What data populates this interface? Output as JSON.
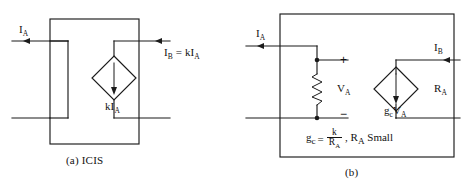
{
  "figure": {
    "background_color": "#ffffff",
    "line_color": "#1b1b1b",
    "panels": [
      {
        "id": "a",
        "caption": "(a) ICIS",
        "labels": {
          "input_current": "I",
          "input_current_sub": "A",
          "output_relation": "I",
          "output_relation_sub": "B",
          "output_relation_rest": " = kI",
          "output_relation_rest_sub": "A",
          "source_label": "kI",
          "source_label_sub": "A"
        }
      },
      {
        "id": "b",
        "caption": "(b)",
        "labels": {
          "input_current": "I",
          "input_current_sub": "A",
          "output_current": "I",
          "output_current_sub": "B",
          "resistance": "R",
          "resistance_sub": "A",
          "voltage": "V",
          "voltage_sub": "A",
          "plus_sign": "+",
          "minus_sign": "−",
          "source_label": "g",
          "source_label_sub": "c",
          "source_label_rest": "V",
          "source_label_rest_sub": "A"
        },
        "formula": {
          "lhs": "g",
          "lhs_sub": "c",
          "equals": "=",
          "numerator": "k",
          "denominator": "R",
          "denominator_sub": "A",
          "tail": ", R",
          "tail_sub": "A",
          "tail_rest": " Small"
        }
      }
    ]
  }
}
